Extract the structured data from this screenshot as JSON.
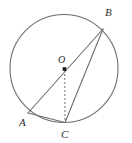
{
  "figure": {
    "kind": "circle-geometry-diagram",
    "background_color": "#ffffff",
    "stroke_color": "#6e6e6e",
    "label_color": "#2b2b2b",
    "canvas": {
      "width": 132,
      "height": 143
    }
  },
  "circle": {
    "name": "main-circle",
    "cx": 64,
    "cy": 68.5,
    "r": 54,
    "stroke": "#6e6e6e",
    "stroke_width": 1.1,
    "fill": "none"
  },
  "center": {
    "name": "center-point-O",
    "label": "O",
    "x": 64.5,
    "y": 69,
    "marker": "filled-square",
    "marker_size": 3.6,
    "marker_color": "#1a1a1a",
    "label_x": 58,
    "label_y": 55
  },
  "points": [
    {
      "id": "A",
      "label": "A",
      "x": 28,
      "y": 113,
      "label_x": 19,
      "label_y": 117
    },
    {
      "id": "B",
      "label": "B",
      "x": 103,
      "y": 29,
      "label_x": 105,
      "label_y": 7
    },
    {
      "id": "C",
      "label": "C",
      "x": 65,
      "y": 122.5,
      "label_x": 61,
      "label_y": 129
    }
  ],
  "segments": [
    {
      "name": "segment-AB-through-center",
      "from": "A",
      "to": "B",
      "x1": 28,
      "y1": 113,
      "x2": 103,
      "y2": 29,
      "style": "solid",
      "stroke": "#6e6e6e",
      "stroke_width": 1.1
    },
    {
      "name": "segment-BC",
      "from": "B",
      "to": "C",
      "x1": 103,
      "y1": 29,
      "x2": 65,
      "y2": 122.5,
      "style": "solid",
      "stroke": "#6e6e6e",
      "stroke_width": 1.1
    },
    {
      "name": "segment-AC",
      "from": "A",
      "to": "C",
      "x1": 28,
      "y1": 113,
      "x2": 65,
      "y2": 122.5,
      "style": "solid",
      "stroke": "#6e6e6e",
      "stroke_width": 1.1
    },
    {
      "name": "segment-OC-dashed",
      "from": "O",
      "to": "C",
      "x1": 64.8,
      "y1": 70,
      "x2": 65,
      "y2": 122.5,
      "style": "dashed",
      "dash_pattern": "2,2",
      "stroke": "#6e6e6e",
      "stroke_width": 1.0
    }
  ]
}
